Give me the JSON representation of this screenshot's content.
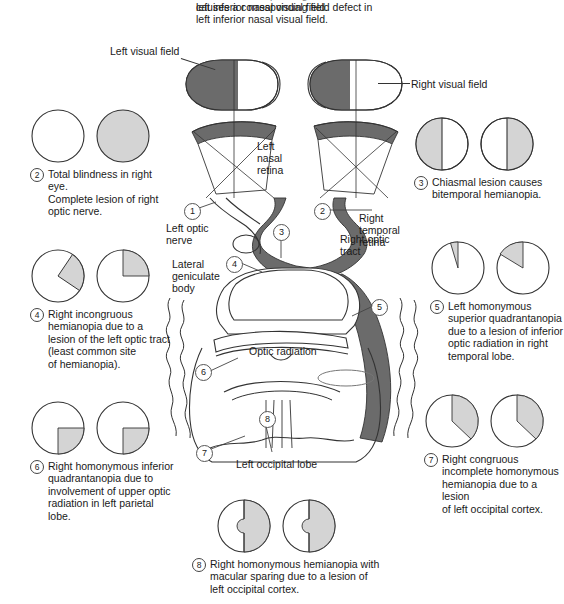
{
  "figure": {
    "title_partial": "Lesion in left superior optic radiation causes a corresponding field defect in left inferior nasal visual field.",
    "top_note_lines": [
      "causes a corresponding field defect in",
      "left inferior nasal visual field."
    ]
  },
  "colors": {
    "dark_pathway": "#6b6b6b",
    "shaded_field": "#d4d4d4",
    "outline": "#333333",
    "text": "#1a1a1a"
  },
  "anatomy_labels": {
    "left_visual_field": "Left visual field",
    "right_visual_field": "Right visual field",
    "left_nasal_retina": "Left\nnasal\nretina",
    "left_nasal_retina_lines": [
      "Left",
      "nasal",
      "retina"
    ],
    "right_temporal_retina_lines": [
      "Right",
      "temporal",
      "retina"
    ],
    "left_optic_nerve_lines": [
      "Left optic",
      "nerve"
    ],
    "right_optic_tract_lines": [
      "Right optic",
      "tract"
    ],
    "lateral_geniculate_body_lines": [
      "Lateral",
      "geniculate",
      "body"
    ],
    "optic_radiation": "Optic radiation",
    "left_occipital_lobe": "Left occipital lobe"
  },
  "markers": [
    {
      "id": "1",
      "label": "1"
    },
    {
      "id": "2",
      "label": "2"
    },
    {
      "id": "3",
      "label": "3"
    },
    {
      "id": "4",
      "label": "4"
    },
    {
      "id": "5",
      "label": "5"
    },
    {
      "id": "6",
      "label": "6"
    },
    {
      "id": "7",
      "label": "7"
    },
    {
      "id": "8",
      "label": "8"
    }
  ],
  "defects": {
    "two": {
      "number": "2",
      "text": "Total blindness in right eye. Complete lesion of right optic nerve.",
      "lines": [
        "Total blindness in right eye.",
        "Complete lesion of right",
        "optic nerve."
      ],
      "left_field": "none",
      "right_field": "full"
    },
    "three": {
      "number": "3",
      "text": "Chiasmal lesion causes bitemporal hemianopia.",
      "lines": [
        "Chiasmal lesion causes",
        "bitemporal hemianopia."
      ],
      "left_field": "left-half",
      "right_field": "right-half"
    },
    "four": {
      "number": "4",
      "text": "Right incongruous hemianopia due to a lesion of the left optic tract (least common site of hemianopia).",
      "lines": [
        "Right incongruous",
        "hemianopia due to a",
        "lesion of the left optic tract",
        "(least common site",
        "of hemianopia)."
      ],
      "left_field": "narrow-upper-right-wedge",
      "right_field": "upper-right-quadrant"
    },
    "five": {
      "number": "5",
      "text": "Left homonymous superior quadrantanopia due to a lesion of inferior optic radiation in right temporal lobe.",
      "lines": [
        "Left homonymous",
        "superior quadrantanopia",
        "due to a lesion of inferior",
        "optic radiation in right",
        "temporal lobe."
      ],
      "left_field": "narrow-upper-left-wedge",
      "right_field": "wide-upper-left-wedge"
    },
    "six": {
      "number": "6",
      "text": "Right homonymous inferior quadrantanopia due to involvement of upper optic radiation in left parietal lobe.",
      "lines": [
        "Right homonymous inferior",
        "quadrantanopia due to",
        "involvement of upper optic",
        "radiation in left parietal lobe."
      ],
      "left_field": "lower-right-quadrant",
      "right_field": "lower-right-quadrant"
    },
    "seven": {
      "number": "7",
      "text": "Right congruous incomplete homonymous hemianopia due to a lesion of left occipital cortex.",
      "lines": [
        "Right congruous",
        "incomplete homonymous",
        "hemianopia due to a lesion",
        "of left occipital cortex."
      ],
      "left_field": "right-wedge",
      "right_field": "right-wedge"
    },
    "eight": {
      "number": "8",
      "text": "Right homonymous hemianopia with macular sparing due to a lesion of left occipital cortex.",
      "lines": [
        "Right homonymous hemianopia with",
        "macular sparing due to a lesion of",
        "left occipital cortex."
      ],
      "left_field": "right-half-macular-sparing",
      "right_field": "right-half-macular-sparing"
    }
  }
}
